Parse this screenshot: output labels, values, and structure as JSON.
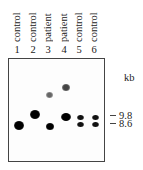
{
  "figure": {
    "lanes": [
      {
        "number": "1",
        "label": "control"
      },
      {
        "number": "2",
        "label": "control"
      },
      {
        "number": "3",
        "label": "patient"
      },
      {
        "number": "4",
        "label": "patient"
      },
      {
        "number": "5",
        "label": "control"
      },
      {
        "number": "6",
        "label": "control"
      }
    ],
    "unit_label": "kb",
    "markers": [
      {
        "label": "9.8"
      },
      {
        "label": "8.6"
      }
    ]
  }
}
